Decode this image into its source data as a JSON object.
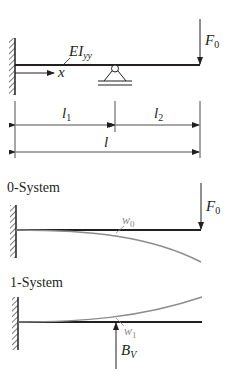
{
  "diagram": {
    "type": "beam-statics",
    "main_system": {
      "beam_label": {
        "base": "EI",
        "sub": "yy"
      },
      "axis_label": "x",
      "load": {
        "base": "F",
        "sub": "0"
      },
      "support": "roller-support",
      "fixed_end": "clamped-wall-left"
    },
    "dimensions": {
      "l1": {
        "base": "l",
        "sub": "1"
      },
      "l2": {
        "base": "l",
        "sub": "2"
      },
      "l": {
        "base": "l"
      }
    },
    "system0": {
      "title": "0-System",
      "load": {
        "base": "F",
        "sub": "0"
      },
      "deflection": {
        "base": "w",
        "sub": "0"
      }
    },
    "system1": {
      "title": "1-System",
      "load": {
        "base": "B",
        "sub": "V"
      },
      "deflection": {
        "base": "w",
        "sub": "1"
      }
    },
    "colors": {
      "line": "#231f20",
      "deflection_curve": "#8c8c8c"
    }
  }
}
